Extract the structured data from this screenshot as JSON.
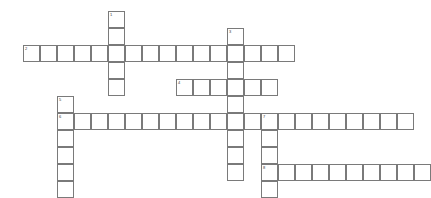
{
  "puzzle": {
    "title": "Crossword Grid",
    "cell_size": 17,
    "origin_x": 6,
    "origin_y": 11,
    "grid_cols": 25,
    "grid_rows": 11,
    "colors": {
      "cell_border": "#7a7a7a",
      "cell_fill": "#ffffff",
      "background": "#ffffff",
      "number_text": "#3a3a3a"
    },
    "entries": [
      {
        "number": "1",
        "direction": "down",
        "length": 5,
        "col": 6,
        "row": 0,
        "letters": [
          "",
          "",
          "",
          "",
          ""
        ]
      },
      {
        "number": "2",
        "direction": "across",
        "length": 16,
        "col": 1,
        "row": 2,
        "letters": [
          "",
          "",
          "",
          "",
          "",
          "",
          "",
          "",
          "",
          "",
          "",
          "",
          "",
          "",
          "",
          ""
        ]
      },
      {
        "number": "3",
        "direction": "down",
        "length": 9,
        "col": 13,
        "row": 1,
        "letters": [
          "",
          "",
          "",
          "",
          "",
          "",
          "",
          "",
          ""
        ]
      },
      {
        "number": "4",
        "direction": "across",
        "length": 6,
        "col": 10,
        "row": 4,
        "letters": [
          "",
          "",
          "",
          "",
          "",
          ""
        ]
      },
      {
        "number": "5",
        "direction": "down",
        "length": 6,
        "col": 3,
        "row": 5,
        "letters": [
          "",
          "",
          "",
          "",
          "",
          ""
        ]
      },
      {
        "number": "6",
        "direction": "across",
        "length": 21,
        "col": 3,
        "row": 6,
        "letters": [
          "",
          "",
          "",
          "",
          "",
          "",
          "",
          "",
          "",
          "",
          "",
          "",
          "",
          "",
          "",
          "",
          "",
          "",
          "",
          "",
          ""
        ]
      },
      {
        "number": "7",
        "direction": "down",
        "length": 5,
        "col": 15,
        "row": 6,
        "letters": [
          "",
          "",
          "",
          "",
          ""
        ]
      },
      {
        "number": "8",
        "direction": "across",
        "length": 10,
        "col": 15,
        "row": 9,
        "letters": [
          "",
          "",
          "",
          "",
          "",
          "",
          "",
          "",
          "",
          ""
        ]
      }
    ]
  }
}
